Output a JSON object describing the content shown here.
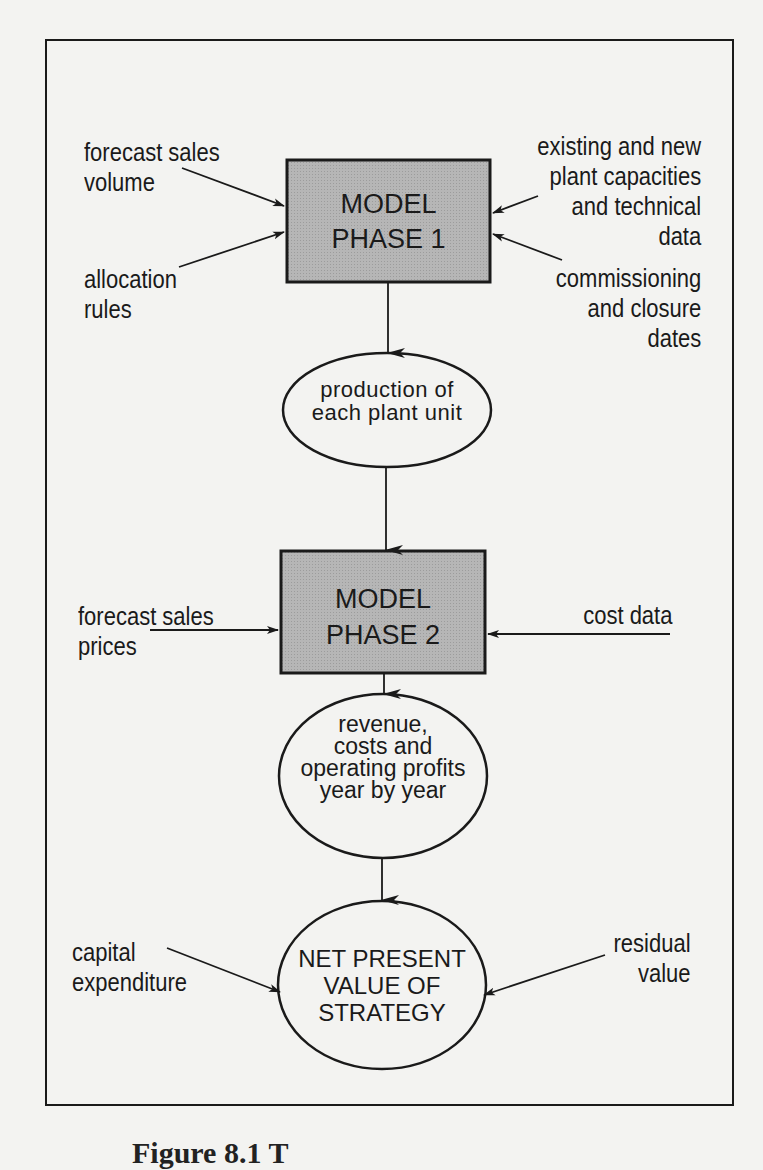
{
  "diagram": {
    "nodes": {
      "model_phase_1": {
        "lines": [
          "MODEL",
          "PHASE 1"
        ],
        "shape": "rectangle",
        "fill": "#b3b3b3"
      },
      "production": {
        "lines": [
          "production of",
          "each plant unit"
        ],
        "shape": "ellipse"
      },
      "model_phase_2": {
        "lines": [
          "MODEL",
          "PHASE 2"
        ],
        "shape": "rectangle",
        "fill": "#b3b3b3"
      },
      "revenue": {
        "lines": [
          "revenue,",
          "costs and",
          "operating profits",
          "year by year"
        ],
        "shape": "ellipse"
      },
      "npv": {
        "lines": [
          "NET PRESENT",
          "VALUE OF",
          "STRATEGY"
        ],
        "shape": "ellipse"
      }
    },
    "inputs": {
      "forecast_sales_volume": {
        "lines": [
          "forecast sales",
          "volume"
        ],
        "target": "model_phase_1"
      },
      "allocation_rules": {
        "lines": [
          "allocation",
          "rules"
        ],
        "target": "model_phase_1"
      },
      "plant_capacities": {
        "lines": [
          "existing and new",
          "plant capacities",
          "and technical",
          "data"
        ],
        "target": "model_phase_1"
      },
      "commissioning_dates": {
        "lines": [
          "commissioning",
          "and closure",
          "dates"
        ],
        "target": "model_phase_1"
      },
      "forecast_sales_prices": {
        "lines": [
          "forecast sales",
          "prices"
        ],
        "target": "model_phase_2"
      },
      "cost_data": {
        "lines": [
          "cost data"
        ],
        "target": "model_phase_2"
      },
      "capital_expenditure": {
        "lines": [
          "capital",
          "expenditure"
        ],
        "target": "npv"
      },
      "residual_value": {
        "lines": [
          "residual",
          "value"
        ],
        "target": "npv"
      }
    },
    "flow": [
      "model_phase_1",
      "production",
      "model_phase_2",
      "revenue",
      "npv"
    ],
    "caption": "Figure 8.1 T"
  },
  "colors": {
    "background": "#f3f3f1",
    "ink": "#1a1a1a",
    "box_fill": "#b3b3b3"
  }
}
